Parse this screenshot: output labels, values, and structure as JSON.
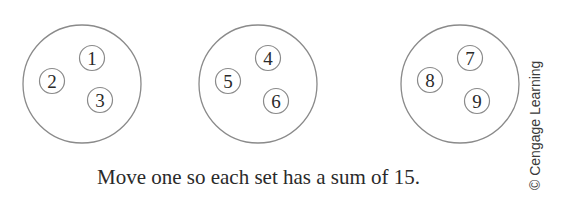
{
  "sets": [
    {
      "id": "set-1",
      "values": [
        "1",
        "2",
        "3"
      ]
    },
    {
      "id": "set-2",
      "values": [
        "4",
        "5",
        "6"
      ]
    },
    {
      "id": "set-3",
      "values": [
        "7",
        "8",
        "9"
      ]
    }
  ],
  "caption": "Move one so each set has a sum of 15.",
  "credit": "© Cengage Learning",
  "colors": {
    "stroke": "#8a8a8a",
    "text": "#2a2a2a",
    "background": "#ffffff"
  }
}
